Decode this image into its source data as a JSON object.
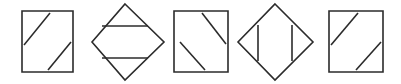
{
  "canvas": {
    "width": 401,
    "height": 84,
    "background_color": "#ffffff",
    "stroke_color": "#2b2b2b",
    "stroke_width": 1.6,
    "figure_count": 5,
    "description": "Row of five outlined geometric figures: squares and diamonds each crossed by two parallel internal chord lines"
  },
  "figures": [
    {
      "index": 1,
      "name": "square-with-two-parallel-up-diagonals",
      "outline_type": "square",
      "outline_points": "22,11 73,11 73,72 22,72",
      "chord_orientation": "diagonal-up-right",
      "chord_count": 2,
      "chords": [
        {
          "x1": 24,
          "y1": 45,
          "x2": 50,
          "y2": 13
        },
        {
          "x1": 48,
          "y1": 70,
          "x2": 71,
          "y2": 42
        }
      ]
    },
    {
      "index": 2,
      "name": "diamond-with-two-horizontal-chords",
      "outline_type": "diamond",
      "outline_points": "125,4 164,42 125,80 92,42",
      "chord_orientation": "horizontal",
      "chord_count": 2,
      "chords": [
        {
          "x1": 102,
          "y1": 26,
          "x2": 148,
          "y2": 26
        },
        {
          "x1": 102,
          "y1": 58,
          "x2": 148,
          "y2": 58
        }
      ]
    },
    {
      "index": 3,
      "name": "square-with-two-parallel-down-diagonals",
      "outline_type": "square",
      "outline_points": "174,11 228,11 228,72 174,72"
    },
    {
      "index": 4,
      "name": "diamond-with-two-vertical-chords",
      "outline_type": "diamond",
      "outline_points": "275,4 313,42 275,80 238,42",
      "chord_orientation": "vertical",
      "chord_count": 2,
      "chords": [
        {
          "x1": 258,
          "y1": 25,
          "x2": 258,
          "y2": 61
        },
        {
          "x1": 292,
          "y1": 25,
          "x2": 292,
          "y2": 61
        }
      ]
    },
    {
      "index": 5,
      "name": "square-with-two-parallel-up-diagonals-repeat",
      "outline_type": "square",
      "outline_points": "329,11 383,11 383,72 329,72"
    }
  ],
  "figure_3_chords": [
    {
      "x1": 180,
      "y1": 42,
      "x2": 205,
      "y2": 70
    },
    {
      "x1": 202,
      "y1": 13,
      "x2": 226,
      "y2": 44
    }
  ],
  "figure_5_chords": [
    {
      "x1": 331,
      "y1": 45,
      "x2": 358,
      "y2": 13
    },
    {
      "x1": 356,
      "y1": 70,
      "x2": 381,
      "y2": 42
    }
  ]
}
